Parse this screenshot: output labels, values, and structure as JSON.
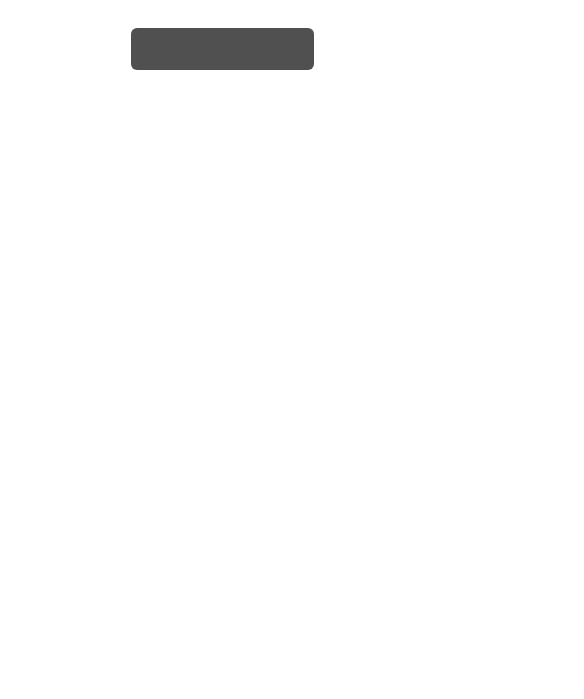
{
  "cash_flows": {
    "title": "Analysis of statement of cash flows",
    "sections": [
      {
        "label": "Operating",
        "points": [
          "Profit or loss?",
          "Depreciation (purchase/sale of PPE)?",
          "P/L on disposal of PPE: why sold?",
          "Return on investments?",
          "Working capital management?",
          "Interest compared to borrowings?"
        ]
      },
      {
        "label": "Investing",
        "points": [
          "Acquisitions in year? How funded?",
          "Disposals in year? Why? Impact?",
          "Interest/dividend received (return on investment)?"
        ]
      },
      {
        "label": "Financing",
        "points": [
          "New finance raised? Debt or equity?",
          "Why new finance raised?",
          "Finance repaid? How afforded?",
          "Dividend as % of PBT?",
          "Generosity of dividend policy?"
        ]
      },
      {
        "label": "Ratios",
        "points": []
      }
    ]
  },
  "segment": {
    "title": "Analysis of segment report",
    "points_heading": "Points to consider:",
    "points": [
      "Growing vs declining segments?",
      "Segments in loss?",
      "Return?",
      "Unallocated costs, assets, liabilities?"
    ],
    "ratios_heading": "Relevant ratios:",
    "ratios": [
      "% change in revenue",
      "Margin (result/revenue)",
      "Return on assets (result/assets)",
      "Return on net assets (result/assets less liabilities)",
      "Return on associates (share of profit/investment in associate)"
    ]
  },
  "formulas": [
    {
      "name": "Cash return on capital employed",
      "numerator": "Cash generated from operations",
      "denominator": "Capital employed",
      "multiplier": "×100%"
    },
    {
      "name": "Cash generated from operations to toal debt",
      "numerator": "Cash generated from operations",
      "denominator": "Long-term borrowings",
      "multiplier": ""
    },
    {
      "name": "Net cash from operating activities to capital expenditure",
      "numerator": "Net cash from operating activities",
      "denominator": "Net capital expenditure",
      "multiplier": "×100%"
    }
  ],
  "equals": "="
}
